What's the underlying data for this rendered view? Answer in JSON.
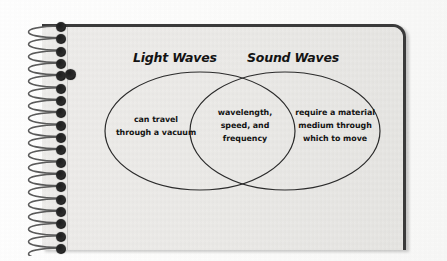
{
  "document": {
    "type": "venn-diagram",
    "medium": "spiral-bound notebook page",
    "paper_color": "#e9e8e6",
    "ink_color": "#141414"
  },
  "diagram": {
    "titles": {
      "left": "Light Waves",
      "right": "Sound Waves"
    },
    "regions": {
      "left_only": "can travel\nthrough a vacuum",
      "intersection": "wavelength,\nspeed, and\nfrequency",
      "right_only": "require a material\nmedium through\nwhich to move"
    }
  },
  "chart_data": {
    "type": "venn",
    "title": "",
    "sets": [
      {
        "name": "Light Waves",
        "label_position": "top-left",
        "exclusive_items": [
          "can travel through a vacuum"
        ],
        "cx": 200,
        "cy": 131,
        "rx": 95,
        "ry": 59
      },
      {
        "name": "Sound Waves",
        "label_position": "top-right",
        "exclusive_items": [
          "require a material medium through which to move"
        ],
        "cx": 285,
        "cy": 131,
        "rx": 95,
        "ry": 59
      }
    ],
    "intersection": {
      "sets": [
        "Light Waves",
        "Sound Waves"
      ],
      "items": [
        "wavelength",
        "speed",
        "frequency"
      ]
    },
    "legend": "none",
    "grid": false
  },
  "notebook": {
    "spiral_loop_count": 19,
    "punch_hole_count": 19,
    "hole_punch_mark": "single dark hole at upper left of page"
  }
}
